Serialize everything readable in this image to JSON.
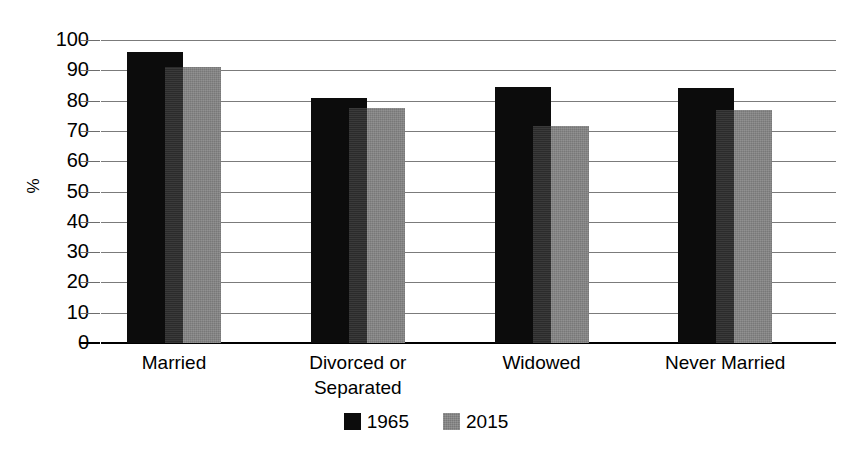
{
  "chart_data": {
    "type": "bar",
    "title": "",
    "subtitle": "",
    "xlabel": "",
    "ylabel": "%",
    "ylim": [
      0,
      100
    ],
    "ytick_step": 10,
    "yticks": [
      100,
      90,
      80,
      70,
      60,
      50,
      40,
      30,
      20,
      10,
      0
    ],
    "ytick_labels": [
      "100",
      "90",
      "80",
      "70",
      "60",
      "50",
      "40",
      "30",
      "20",
      "10",
      "0"
    ],
    "grid": true,
    "grid_axis": "y",
    "legend_position": "bottom-center",
    "bar_style": "overlapping-grouped",
    "categories": [
      "Married",
      "Divorced or\nSeparated",
      "Widowed",
      "Never Married"
    ],
    "category_labels_flat": [
      "Married",
      "Divorced or Separated",
      "Widowed",
      "Never Married"
    ],
    "series": [
      {
        "name": "1965",
        "color": "#0c0c0c",
        "values": [
          96,
          81,
          84.5,
          84
        ]
      },
      {
        "name": "2015",
        "color": "#787878",
        "values": [
          91,
          77.5,
          71.5,
          77
        ]
      }
    ],
    "units": "percent"
  },
  "legend": {
    "items": [
      {
        "label": "1965",
        "swatch": "black-square-swatch"
      },
      {
        "label": "2015",
        "swatch": "gray-square-swatch"
      }
    ]
  },
  "axes": {
    "y_title": "%"
  }
}
